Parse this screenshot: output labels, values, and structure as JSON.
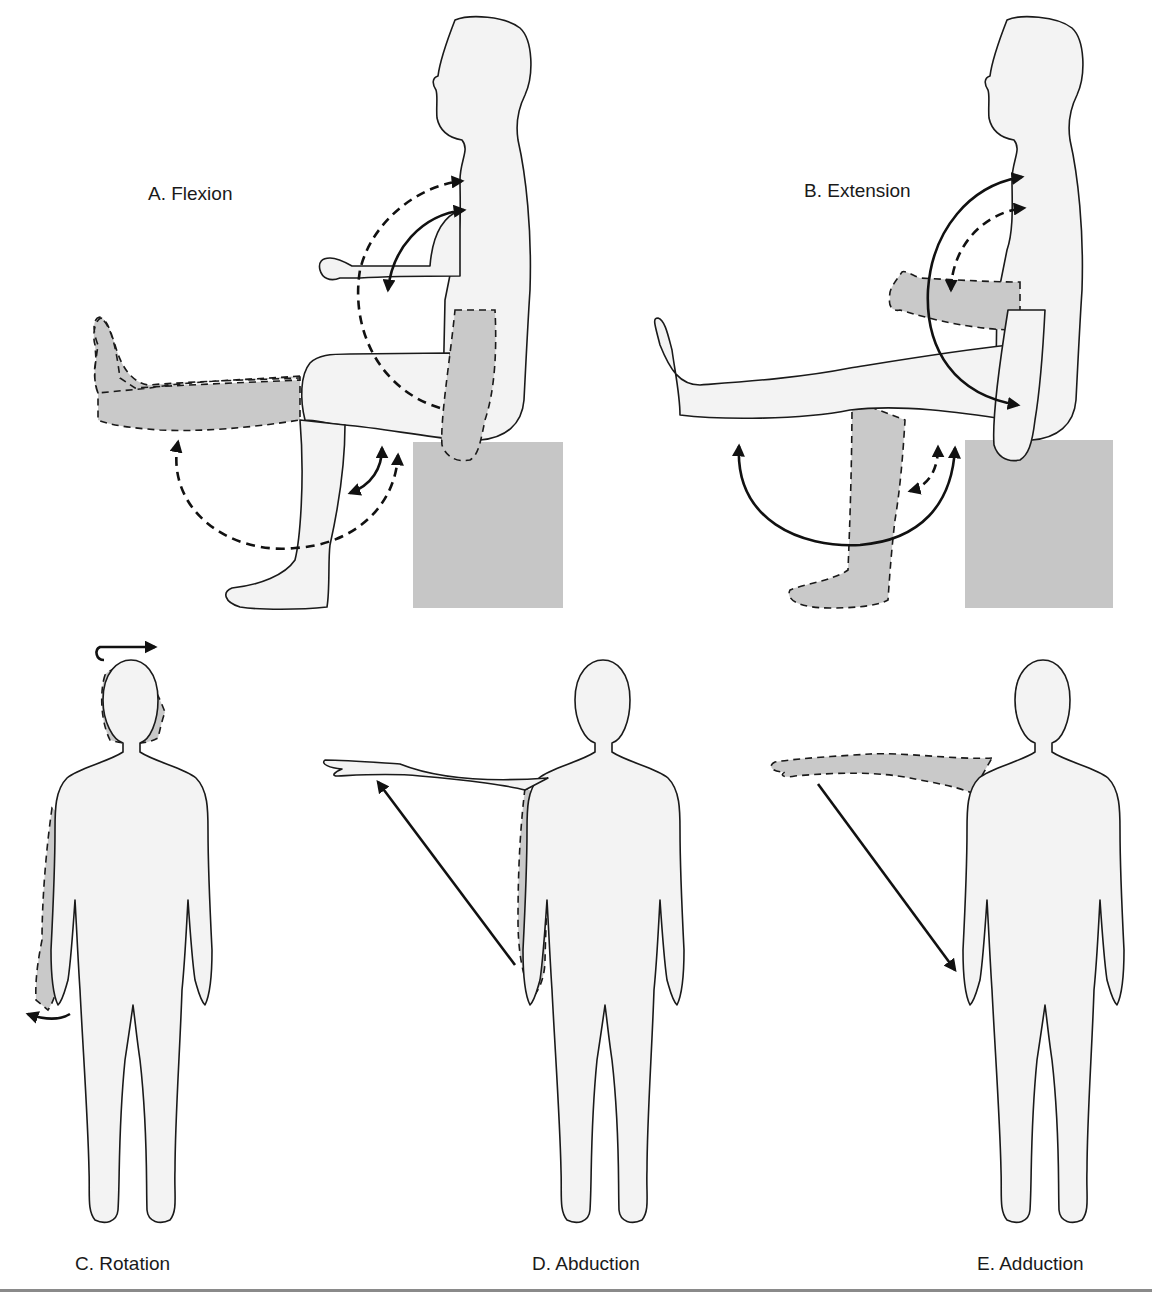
{
  "figure": {
    "panels": [
      {
        "id": "A",
        "label": "A. Flexion",
        "pose": "seated-side-view",
        "movement": "flexion"
      },
      {
        "id": "B",
        "label": "B. Extension",
        "pose": "seated-side-view",
        "movement": "extension"
      },
      {
        "id": "C",
        "label": "C. Rotation",
        "pose": "standing-front-view",
        "movement": "rotation"
      },
      {
        "id": "D",
        "label": "D. Abduction",
        "pose": "standing-front-view",
        "movement": "abduction"
      },
      {
        "id": "E",
        "label": "E. Adduction",
        "pose": "standing-front-view",
        "movement": "adduction"
      }
    ],
    "colors": {
      "skin_fill": "#f3f3f3",
      "ghost_fill": "#c9c9c9",
      "block_fill": "#c6c6c6",
      "outline": "#1a1a1a",
      "rule": "#8a8a8a"
    },
    "icons": [
      "solid-arc-arrow",
      "dashed-arc-arrow",
      "straight-arrow",
      "rotation-arrow"
    ]
  }
}
